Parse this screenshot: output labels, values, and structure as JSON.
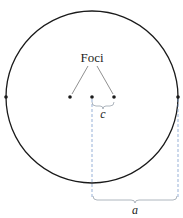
{
  "diagram": {
    "labels": {
      "foci": "Foci",
      "c": "c",
      "a": "a"
    },
    "colors": {
      "stroke": "#1a1a1a",
      "dashed": "#6a8fc7",
      "brace": "#9aa3ad"
    },
    "circle": {
      "cx": 92,
      "cy": 97,
      "r": 86
    },
    "points": [
      {
        "name": "left-vertex",
        "x": 6,
        "y": 97
      },
      {
        "name": "focus-left",
        "x": 70,
        "y": 97
      },
      {
        "name": "center",
        "x": 92,
        "y": 97
      },
      {
        "name": "focus-right",
        "x": 114,
        "y": 97
      },
      {
        "name": "right-vertex",
        "x": 178,
        "y": 97
      }
    ]
  }
}
